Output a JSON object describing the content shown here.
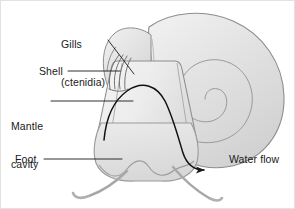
{
  "figure": {
    "background_color": "#ffffff",
    "border_color": "#e2e2e2",
    "ink_color": "#1a1a1a",
    "body_fill": "#e8e8e8",
    "shell_fill": "#dedede",
    "outline_color": "#8a8a8a"
  },
  "labels": {
    "gills": {
      "line1": "Gills",
      "line2": "(ctenidia)"
    },
    "shell": "Shell",
    "mantle": {
      "line1": "Mantle",
      "line2": "cavity"
    },
    "foot": "Foot",
    "water_flow": "Water flow"
  },
  "leaders": {
    "gills": {
      "type": "diagonal-line",
      "from": [
        108,
        40
      ],
      "to": [
        132,
        72
      ]
    },
    "shell": {
      "type": "horizontal-line",
      "from": [
        68,
        70
      ],
      "to": [
        118,
        70
      ]
    },
    "mantle": {
      "type": "horizontal-line",
      "from": [
        50,
        100
      ],
      "to": [
        131,
        100
      ]
    },
    "foot": {
      "type": "horizontal-line",
      "from": [
        44,
        158
      ],
      "to": [
        120,
        158
      ]
    },
    "water_flow": {
      "type": "curved-arrow",
      "arrowhead": "right"
    }
  },
  "structures": {
    "shell_spiral_turns": 2,
    "ctenidia_arcs": 4,
    "tentacles": 2,
    "foot_edge": "wavy"
  }
}
